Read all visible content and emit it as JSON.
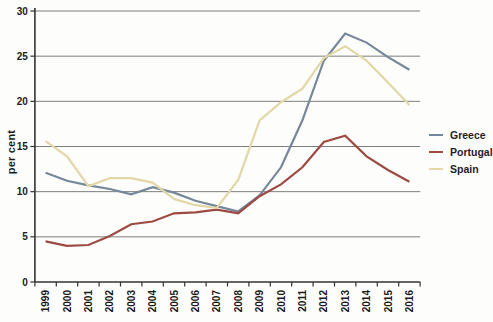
{
  "chart_data": {
    "type": "line",
    "title": "",
    "xlabel": "",
    "ylabel": "per cent",
    "x_labels": [
      "1999",
      "2000",
      "2001",
      "2002",
      "2003",
      "2004",
      "2005",
      "2006",
      "2007",
      "2008",
      "2009",
      "2010",
      "2011",
      "2012",
      "2013",
      "2014",
      "2015",
      "2016"
    ],
    "ylim": [
      0,
      30
    ],
    "yticks": [
      0,
      5,
      10,
      15,
      20,
      25,
      30
    ],
    "grid": "horizontal-only",
    "legend_position": "right-middle",
    "series": [
      {
        "name": "Greece",
        "color": "#76879B",
        "values": [
          12.1,
          11.2,
          10.7,
          10.3,
          9.7,
          10.5,
          9.9,
          9.0,
          8.4,
          7.8,
          9.6,
          12.7,
          17.9,
          24.5,
          27.5,
          26.5,
          24.9,
          23.5
        ]
      },
      {
        "name": "Portugal",
        "color": "#9C4B43",
        "values": [
          4.5,
          4.0,
          4.1,
          5.1,
          6.4,
          6.7,
          7.6,
          7.7,
          8.0,
          7.6,
          9.5,
          10.8,
          12.7,
          15.5,
          16.2,
          13.9,
          12.4,
          11.1
        ]
      },
      {
        "name": "Spain",
        "color": "#E2D7A6",
        "values": [
          15.6,
          13.9,
          10.6,
          11.5,
          11.5,
          11.0,
          9.2,
          8.5,
          8.2,
          11.3,
          17.9,
          19.9,
          21.4,
          24.8,
          26.1,
          24.5,
          22.1,
          19.6
        ]
      }
    ],
    "style": {
      "grid_color": "#7d7d7d",
      "axis_color": "#333333",
      "tick_label_color": "#1b1b1b",
      "background": "#fdfdfb"
    }
  }
}
